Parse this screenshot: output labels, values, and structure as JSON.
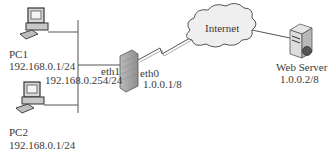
{
  "diagram": {
    "nodes": {
      "pc1": {
        "name": "PC1",
        "ip": "192.168.0.1/24",
        "icon": "desktop-computer-icon"
      },
      "pc2": {
        "name": "PC2",
        "ip": "192.168.0.1/24",
        "icon": "desktop-computer-icon"
      },
      "firewall": {
        "icon": "firewall-icon",
        "eth1": {
          "label": "eth1",
          "ip": "192.168.0.254/24"
        },
        "eth0": {
          "label": "eth0",
          "ip": "1.0.0.1/8"
        }
      },
      "internet": {
        "name": "Internet",
        "icon": "cloud-icon"
      },
      "web_server": {
        "name": "Web Server",
        "ip": "1.0.0.2/8",
        "icon": "server-icon"
      }
    },
    "colors": {
      "line": "#555555",
      "cloud_fill": "#eeeeee",
      "device_fill": "#d0d0d0"
    }
  }
}
